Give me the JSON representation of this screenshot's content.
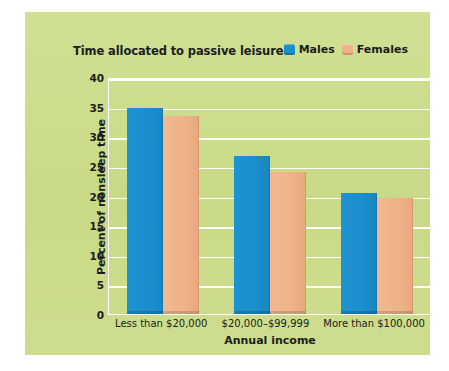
{
  "panel": {
    "background_color": "#cbdd8b"
  },
  "chart_data": {
    "type": "bar",
    "title": "Time allocated to passive leisure",
    "xlabel": "Annual income",
    "ylabel": "Percent of nonsleep time",
    "categories": [
      "Less than $20,000",
      "$20,000–$99,999",
      "More than $100,000"
    ],
    "series": [
      {
        "name": "Males",
        "color": "#1b8ecb",
        "values": [
          34.8,
          26.6,
          20.5
        ]
      },
      {
        "name": "Females",
        "color": "#efb289",
        "values": [
          33.5,
          24.0,
          19.6
        ]
      }
    ],
    "ylim": [
      0,
      40
    ],
    "yticks": [
      40,
      35,
      30,
      25,
      20,
      15,
      10,
      5,
      0
    ],
    "grid": true,
    "grid_color": "#ffffff",
    "legend_position": "top-right"
  }
}
